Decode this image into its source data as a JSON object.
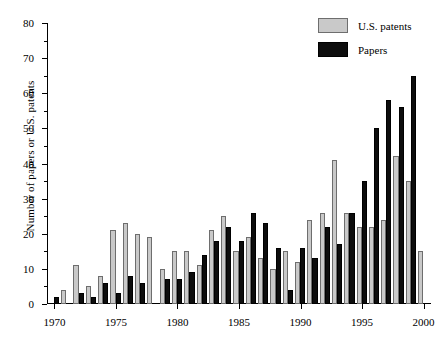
{
  "chart_data": {
    "type": "bar",
    "title": "",
    "xlabel": "",
    "ylabel": "Number of papers or U.S. patents",
    "xlim": [
      1969.4,
      2000.6
    ],
    "ylim": [
      0,
      80
    ],
    "yticks": [
      0,
      10,
      20,
      30,
      40,
      50,
      60,
      70,
      80
    ],
    "ytick_labels": [
      "0",
      "10",
      "20",
      "30",
      "40",
      "50",
      "60",
      "70",
      "80"
    ],
    "xticks": [
      1970,
      1975,
      1980,
      1985,
      1990,
      1995,
      2000
    ],
    "xtick_labels": [
      "1970",
      "1975",
      "1980",
      "1985",
      "1990",
      "1995",
      "2000"
    ],
    "grid": false,
    "legend_position": "top-right",
    "categories": [
      1970,
      1971,
      1972,
      1973,
      1974,
      1975,
      1976,
      1977,
      1978,
      1979,
      1980,
      1981,
      1982,
      1983,
      1984,
      1985,
      1986,
      1987,
      1988,
      1989,
      1990,
      1991,
      1992,
      1993,
      1994,
      1995,
      1996,
      1997,
      1998,
      1999,
      2000
    ],
    "series": [
      {
        "name": "U.S. patents",
        "color": "#c9c9c9",
        "edge_color": "#6e6e6e",
        "values": [
          0,
          4,
          11,
          5,
          8,
          21,
          23,
          20,
          19,
          10,
          15,
          15,
          11,
          21,
          25,
          15,
          19,
          13,
          10,
          15,
          12,
          24,
          26,
          41,
          26,
          22,
          22,
          24,
          42,
          35,
          15
        ]
      },
      {
        "name": "Papers",
        "color": "#0d0d0d",
        "edge_color": "#000000",
        "values": [
          2,
          0,
          3,
          2,
          6,
          3,
          8,
          6,
          0,
          7,
          7,
          9,
          14,
          18,
          22,
          18,
          26,
          23,
          16,
          4,
          16,
          13,
          22,
          17,
          26,
          35,
          50,
          58,
          56,
          65,
          0
        ]
      }
    ]
  },
  "legend": {
    "items": [
      {
        "label": "U.S. patents",
        "swatch": "patents"
      },
      {
        "label": "Papers",
        "swatch": "papers"
      }
    ]
  }
}
